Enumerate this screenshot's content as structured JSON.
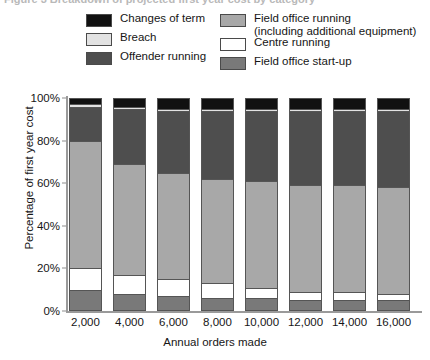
{
  "caption": {
    "clipped_text": "Figure 3  Breakdown of projected first year cost by category"
  },
  "legend": {
    "left_column": [
      {
        "label": "Changes of term",
        "color": "#111111",
        "swatch_name": "legend-swatch-changes-of-term"
      },
      {
        "label": "Breach",
        "color": "#e2e2e2",
        "swatch_name": "legend-swatch-breach"
      },
      {
        "label": "Offender running",
        "color": "#4e4e4e",
        "swatch_name": "legend-swatch-offender-running"
      }
    ],
    "right_column": [
      {
        "label": "Field office running\n(including additional equipment)",
        "color": "#a8a8a8",
        "swatch_name": "legend-swatch-field-office-running"
      },
      {
        "label": "Centre running",
        "color": "#ffffff",
        "swatch_name": "legend-swatch-centre-running"
      },
      {
        "label": "Field office start-up",
        "color": "#797979",
        "swatch_name": "legend-swatch-field-office-start-up"
      }
    ]
  },
  "chart_data": {
    "type": "bar",
    "subtype": "stacked-percentage",
    "title": "",
    "xlabel": "Annual orders made",
    "ylabel": "Percentage of first year cost",
    "categories": [
      "2,000",
      "4,000",
      "6,000",
      "8,000",
      "10,000",
      "12,000",
      "14,000",
      "16,000"
    ],
    "ylim": [
      0,
      100
    ],
    "yticks": [
      "0%",
      "20%",
      "40%",
      "60%",
      "80%",
      "100%"
    ],
    "ytick_values": [
      0,
      20,
      40,
      60,
      80,
      100
    ],
    "grid": false,
    "legend_position": "top",
    "stack_order_bottom_to_top": [
      "Field office start-up",
      "Centre running",
      "Field office running (including additional equipment)",
      "Offender running",
      "Breach",
      "Changes of term"
    ],
    "series": [
      {
        "name": "Field office start-up",
        "color": "#797979",
        "values": [
          10,
          8,
          7,
          6,
          6,
          5,
          5,
          5
        ]
      },
      {
        "name": "Centre running",
        "color": "#ffffff",
        "values": [
          10,
          9,
          8,
          7,
          5,
          4,
          4,
          3
        ]
      },
      {
        "name": "Field office running (including additional equipment)",
        "color": "#a8a8a8",
        "values": [
          60,
          52,
          50,
          49,
          50,
          50,
          50,
          50
        ]
      },
      {
        "name": "Offender running",
        "color": "#4e4e4e",
        "values": [
          16,
          26,
          29,
          32,
          33,
          35,
          35,
          36
        ]
      },
      {
        "name": "Breach",
        "color": "#e2e2e2",
        "values": [
          1,
          1,
          1,
          1,
          1,
          1,
          1,
          1
        ]
      },
      {
        "name": "Changes of term",
        "color": "#111111",
        "values": [
          3,
          4,
          5,
          5,
          5,
          5,
          5,
          5
        ]
      }
    ]
  }
}
